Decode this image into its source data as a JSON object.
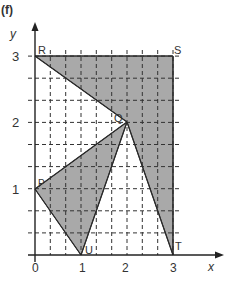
{
  "figure": {
    "label": "(f)",
    "axes": {
      "x_label": "x",
      "y_label": "y",
      "x_ticks": [
        "0",
        "1",
        "2",
        "3"
      ],
      "y_ticks": [
        "1",
        "2",
        "3"
      ],
      "grid": "dashed, every 1/3 unit"
    },
    "points": [
      {
        "name": "R",
        "x": 0,
        "y": 3
      },
      {
        "name": "S",
        "x": 3,
        "y": 3
      },
      {
        "name": "Q",
        "x": 2,
        "y": 2
      },
      {
        "name": "P",
        "x": 0,
        "y": 1
      },
      {
        "name": "U",
        "x": 1,
        "y": 0
      },
      {
        "name": "T",
        "x": 3,
        "y": 0
      }
    ],
    "shaded_regions": [
      {
        "name": "quadrilateral-RSTQ",
        "vertices": [
          "R",
          "S",
          "T",
          "Q"
        ]
      },
      {
        "name": "triangle-PQU",
        "vertices": [
          "P",
          "Q",
          "U"
        ]
      }
    ],
    "colors": {
      "shade": "#a9a9a9",
      "line": "#2a2a2a",
      "grid": "#333333"
    }
  }
}
